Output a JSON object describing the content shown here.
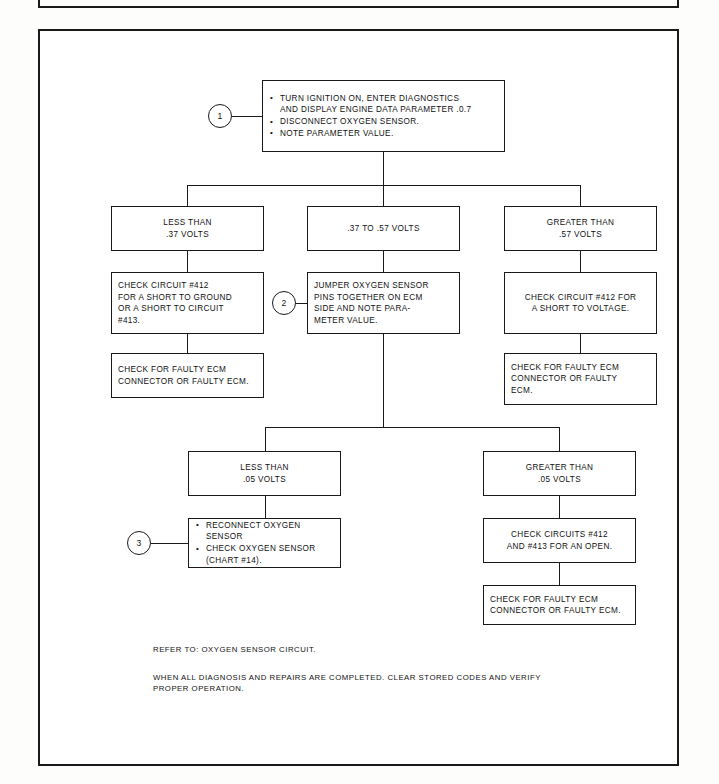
{
  "document": {
    "type": "service-manual-diagnostic-flowchart",
    "title": "Oxygen Sensor Diagnostic Chart"
  },
  "markers": [
    {
      "id": "marker-1",
      "label": "1"
    },
    {
      "id": "marker-2",
      "label": "2"
    },
    {
      "id": "marker-3",
      "label": "3"
    }
  ],
  "nodes": {
    "start": {
      "bullets": [
        "TURN IGNITION ON, ENTER DIAGNOSTICS\nAND DISPLAY ENGINE DATA PARAMETER .0.7",
        "DISCONNECT OXYGEN SENSOR.",
        "NOTE PARAMETER VALUE."
      ]
    },
    "branch_low": {
      "text": "LESS THAN\n.37 VOLTS"
    },
    "branch_mid": {
      "text": ".37 TO .57 VOLTS"
    },
    "branch_high": {
      "text": "GREATER THAN\n.57 VOLTS"
    },
    "low_check": {
      "text": "CHECK CIRCUIT #412\nFOR A SHORT TO GROUND\nOR A SHORT TO CIRCUIT\n#413."
    },
    "low_ecm": {
      "text": "CHECK FOR FAULTY ECM\nCONNECTOR OR FAULTY ECM."
    },
    "mid_jumper": {
      "text": "JUMPER OXYGEN SENSOR\nPINS TOGETHER ON ECM\nSIDE AND NOTE PARA-\nMETER VALUE."
    },
    "high_check": {
      "text": "CHECK CIRCUIT #412 FOR\nA SHORT TO VOLTAGE."
    },
    "high_ecm": {
      "text": "CHECK FOR FAULTY ECM\nCONNECTOR OR FAULTY\nECM."
    },
    "sub_low": {
      "text": "LESS THAN\n.05 VOLTS"
    },
    "sub_high": {
      "text": "GREATER THAN\n.05 VOLTS"
    },
    "sub_low_action": {
      "bullets": [
        "RECONNECT OXYGEN SENSOR",
        "CHECK OXYGEN SENSOR\n(CHART #14)."
      ]
    },
    "sub_high_check": {
      "text": "CHECK CIRCUITS #412\nAND #413 FOR AN OPEN."
    },
    "sub_high_ecm": {
      "text": "CHECK FOR FAULTY ECM\nCONNECTOR OR FAULTY ECM."
    }
  },
  "notes": {
    "refer": "REFER TO: OXYGEN SENSOR CIRCUIT.",
    "closing": "WHEN ALL DIAGNOSIS AND REPAIRS ARE COMPLETED. CLEAR STORED CODES AND VERIFY\nPROPER OPERATION."
  },
  "colors": {
    "ink": "#1a1a1a",
    "paper": "#ffffff"
  }
}
